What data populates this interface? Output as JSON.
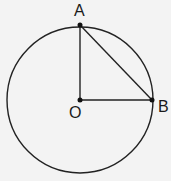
{
  "diagram": {
    "type": "geometry",
    "circle": {
      "cx": 80,
      "cy": 100,
      "r": 73,
      "stroke": "#222222"
    },
    "points": [
      {
        "id": "A",
        "label": "A",
        "x": 80,
        "y": 25,
        "label_x": 74,
        "label_y": 16
      },
      {
        "id": "B",
        "label": "B",
        "x": 152,
        "y": 100,
        "label_x": 158,
        "label_y": 112
      },
      {
        "id": "O",
        "label": "O",
        "x": 80,
        "y": 100,
        "label_x": 69,
        "label_y": 118
      }
    ],
    "segments": [
      {
        "from": "O",
        "to": "A"
      },
      {
        "from": "O",
        "to": "B"
      },
      {
        "from": "A",
        "to": "B"
      }
    ]
  }
}
